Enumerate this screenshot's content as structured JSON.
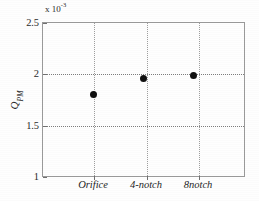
{
  "chart_data": {
    "type": "scatter",
    "title": "",
    "subtitle": "",
    "xlabel": "",
    "ylabel": "Q",
    "ylabel_sub": "PM",
    "exponent_prefix": "x 10",
    "exponent_power": "-3",
    "y_scale_note": "x 10^-3",
    "categories": [
      "Orifice",
      "4-notch",
      "8notch"
    ],
    "values": [
      0.0018,
      0.00196,
      0.00199
    ],
    "values_scaled": [
      1.8,
      1.96,
      1.99
    ],
    "series": [
      {
        "name": "QPM",
        "values": [
          0.0018,
          0.00196,
          0.00199
        ],
        "marker": "filled-circle",
        "color": "#101010"
      }
    ],
    "ylim": [
      0.001,
      0.0025
    ],
    "ylim_scaled": [
      1.0,
      2.5
    ],
    "yticks_scaled": [
      1.0,
      1.5,
      2.0,
      2.5
    ],
    "ytick_labels": [
      "1",
      "1.5",
      "2",
      "2.5"
    ],
    "xtick_labels": [
      "Orifice",
      "4-notch",
      "8notch"
    ],
    "grid": true,
    "grid_style": "dotted",
    "grid_color": "#8a8a8a",
    "legend": false,
    "legend_position": "none",
    "frame_color": "#9a9a9a",
    "background_color": "#ffffff",
    "marker_color": "#101010",
    "annotations": []
  },
  "axes": {
    "y": {
      "ticks": [
        {
          "label": "2.5",
          "value": 2.5
        },
        {
          "label": "2",
          "value": 2.0
        },
        {
          "label": "1.5",
          "value": 1.5
        },
        {
          "label": "1",
          "value": 1.0
        }
      ]
    },
    "x": {
      "ticks": [
        {
          "label": "Orifice",
          "index": 0
        },
        {
          "label": "4-notch",
          "index": 1
        },
        {
          "label": "8notch",
          "index": 2
        }
      ]
    }
  }
}
